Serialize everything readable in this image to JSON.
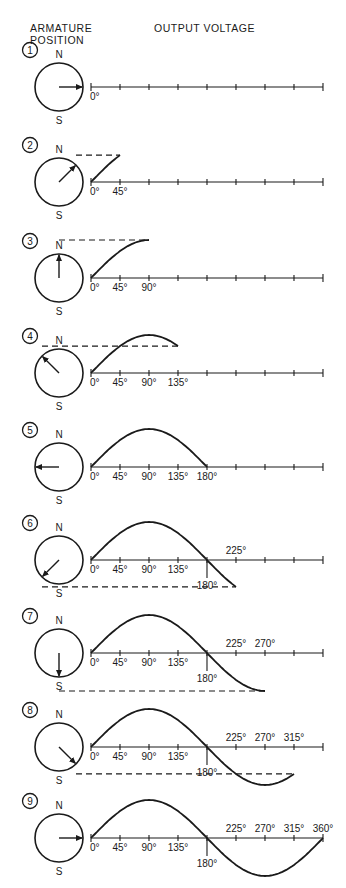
{
  "header": {
    "armature_line1": "ARMATURE",
    "armature_line2": "POSITION",
    "output": "OUTPUT VOLTAGE"
  },
  "poles": {
    "north": "N",
    "south": "S"
  },
  "colors": {
    "ink": "#1a1a1a",
    "background": "#ffffff"
  },
  "axis": {
    "x0": 91,
    "x_per_deg": 0.6444,
    "amplitude": 38,
    "ticks_deg": [
      0,
      45,
      90,
      135,
      180,
      225,
      270,
      315,
      360
    ]
  },
  "rows": [
    {
      "num": "1",
      "y": 87,
      "angle": 0,
      "labels": [
        "0°"
      ]
    },
    {
      "num": "2",
      "y": 182,
      "angle": 45,
      "labels": [
        "0°",
        "45°"
      ]
    },
    {
      "num": "3",
      "y": 278,
      "angle": 90,
      "labels": [
        "0°",
        "45°",
        "90°"
      ]
    },
    {
      "num": "4",
      "y": 373,
      "angle": 135,
      "labels": [
        "0°",
        "45°",
        "90°",
        "135°"
      ]
    },
    {
      "num": "5",
      "y": 467,
      "angle": 180,
      "labels": [
        "0°",
        "45°",
        "90°",
        "135°",
        "180°"
      ]
    },
    {
      "num": "6",
      "y": 560,
      "angle": 225,
      "labels": [
        "0°",
        "45°",
        "90°",
        "135°",
        "180°",
        "225°"
      ]
    },
    {
      "num": "7",
      "y": 653,
      "angle": 270,
      "labels": [
        "0°",
        "45°",
        "90°",
        "135°",
        "180°",
        "225°",
        "270°"
      ]
    },
    {
      "num": "8",
      "y": 747,
      "angle": 315,
      "labels": [
        "0°",
        "45°",
        "90°",
        "135°",
        "180°",
        "225°",
        "270°",
        "315°"
      ]
    },
    {
      "num": "9",
      "y": 838,
      "angle": 360,
      "labels": [
        "0°",
        "45°",
        "90°",
        "135°",
        "180°",
        "225°",
        "270°",
        "315°",
        "360°"
      ]
    }
  ]
}
